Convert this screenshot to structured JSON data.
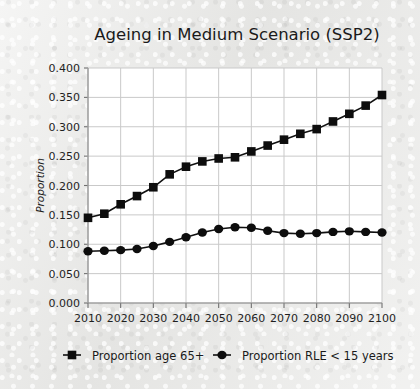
{
  "figure": {
    "title": "Ageing in Medium Scenario (SSP2)",
    "background_color": "#e9e9e7",
    "plot_background_color": "#ffffff",
    "ink_color": "#0d0d0d",
    "grid_color": "#c9c9c9"
  },
  "chart_data": {
    "type": "line",
    "title": "Ageing in Medium Scenario (SSP2)",
    "xlabel": "",
    "ylabel": "Proportion",
    "xlim": [
      2010,
      2100
    ],
    "ylim": [
      0.0,
      0.4
    ],
    "grid": true,
    "legend_position": "bottom",
    "x_ticks": [
      2010,
      2020,
      2030,
      2040,
      2050,
      2060,
      2070,
      2080,
      2090,
      2100
    ],
    "x_tick_labels": [
      "2010",
      "2020",
      "2030",
      "2040",
      "2050",
      "2060",
      "2070",
      "2080",
      "2090",
      "2100"
    ],
    "y_ticks": [
      0.0,
      0.05,
      0.1,
      0.15,
      0.2,
      0.25,
      0.3,
      0.35,
      0.4
    ],
    "y_tick_labels": [
      "0.000",
      "0.050",
      "0.100",
      "0.150",
      "0.200",
      "0.250",
      "0.300",
      "0.350",
      "0.400"
    ],
    "x": [
      2010,
      2015,
      2020,
      2025,
      2030,
      2035,
      2040,
      2045,
      2050,
      2055,
      2060,
      2065,
      2070,
      2075,
      2080,
      2085,
      2090,
      2095,
      2100
    ],
    "series": [
      {
        "name": "Proportion age 65+",
        "marker": "square",
        "values": [
          0.145,
          0.152,
          0.168,
          0.182,
          0.197,
          0.219,
          0.232,
          0.241,
          0.246,
          0.248,
          0.258,
          0.268,
          0.278,
          0.288,
          0.296,
          0.309,
          0.322,
          0.336,
          0.354
        ]
      },
      {
        "name": "Proportion RLE < 15 years",
        "marker": "circle",
        "values": [
          0.088,
          0.089,
          0.09,
          0.092,
          0.097,
          0.104,
          0.112,
          0.12,
          0.126,
          0.129,
          0.128,
          0.123,
          0.119,
          0.118,
          0.119,
          0.121,
          0.122,
          0.121,
          0.12
        ]
      }
    ]
  },
  "legend": {
    "items": [
      {
        "label": "Proportion age 65+",
        "marker": "square"
      },
      {
        "label": "Proportion RLE < 15 years",
        "marker": "circle"
      }
    ]
  }
}
